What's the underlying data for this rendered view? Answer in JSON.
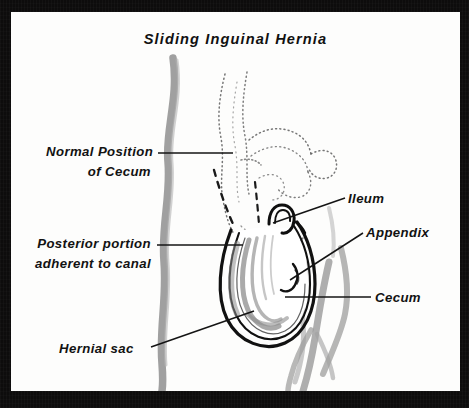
{
  "figure": {
    "title": "Sliding Inguinal Hernia",
    "kind": "medical-illustration",
    "ink_color": "#121212",
    "shade_color": "#8d8d8d",
    "page_color": "#fdfdfc",
    "frame_color": "#0d0c0c"
  },
  "labels": {
    "normal_position_l1": "Normal Position",
    "normal_position_l2": "of Cecum",
    "posterior_l1": "Posterior portion",
    "posterior_l2": "adherent to canal",
    "hernial_sac": "Hernial sac",
    "ileum": "Ileum",
    "appendix": "Appendix",
    "cecum": "Cecum"
  },
  "structures": [
    {
      "name": "normal-position-of-cecum",
      "style": "dotted-ghost",
      "note": "stippled outline of cecum in its normal intra-abdominal position, upper centre"
    },
    {
      "name": "descent-path",
      "style": "dashed",
      "note": "dashed line showing path of descent into the canal"
    },
    {
      "name": "hernial-sac",
      "style": "solid-bold",
      "note": "U-shaped sac outline, lower centre"
    },
    {
      "name": "ileum",
      "style": "solid",
      "note": "small bowel loop entering top of sac"
    },
    {
      "name": "appendix",
      "style": "solid",
      "note": "appendix within the sac"
    },
    {
      "name": "cecum",
      "style": "shaded",
      "note": "cecum forming posterior wall of sac"
    },
    {
      "name": "body-contour",
      "style": "grey-wash",
      "note": "abdominal wall and thigh contours"
    }
  ]
}
